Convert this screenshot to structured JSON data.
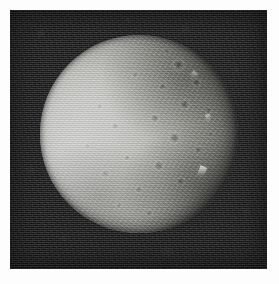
{
  "page": {
    "background_color": "#ffffff",
    "width": 279,
    "height": 284
  },
  "image": {
    "kind": "spacecraft-photograph",
    "subject": "icy moon",
    "description": "Grayscale spacecraft image of a heavily cratered icy satellite against black space. The left portion of the disk is brightly sunlit and washed out; cratered terrain and a terminator shadow fall across the right side.",
    "frame": {
      "x": 10,
      "y": 10,
      "width": 257,
      "height": 259,
      "background_color": "#0e0e0e",
      "noise": "film-grain"
    },
    "disk": {
      "center_x": 139,
      "center_y": 134,
      "radius": 99,
      "highlight_color": "#d8d8d6",
      "midtone_color": "#96968f",
      "shadow_color": "#141415",
      "terminator_side": "right",
      "illumination_direction": "left"
    },
    "features": [
      {
        "name": "sunlit-limb",
        "position": "left"
      },
      {
        "name": "cratered-terrain",
        "position": "center-right"
      },
      {
        "name": "terminator",
        "position": "right"
      },
      {
        "name": "bright-ridge-peak",
        "position": "lower-right"
      }
    ],
    "raster": "horizontal-scanlines"
  }
}
